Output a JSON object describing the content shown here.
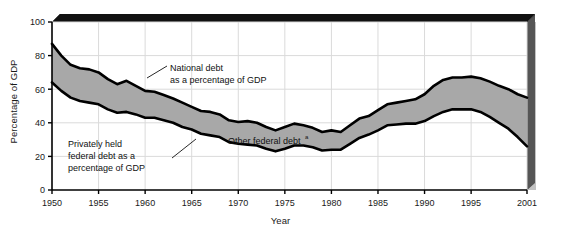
{
  "chart_data": {
    "type": "area",
    "title": "",
    "xlabel": "Year",
    "ylabel": "Percentage of GDP",
    "xlim": [
      1950,
      2001
    ],
    "ylim": [
      0,
      100
    ],
    "grid": true,
    "legend_position": "inline-annotations",
    "x_ticks": [
      "1950",
      "1955",
      "1960",
      "1965",
      "1970",
      "1975",
      "1980",
      "1985",
      "1990",
      "1995",
      "2001"
    ],
    "x_tick_values": [
      1950,
      1955,
      1960,
      1965,
      1970,
      1975,
      1980,
      1985,
      1990,
      1995,
      2001
    ],
    "y_ticks": [
      "0",
      "20",
      "40",
      "60",
      "80",
      "100"
    ],
    "y_tick_values": [
      0,
      20,
      40,
      60,
      80,
      100
    ],
    "x": [
      1950,
      1951,
      1952,
      1953,
      1954,
      1955,
      1956,
      1957,
      1958,
      1959,
      1960,
      1961,
      1962,
      1963,
      1964,
      1965,
      1966,
      1967,
      1968,
      1969,
      1970,
      1971,
      1972,
      1973,
      1974,
      1975,
      1976,
      1977,
      1978,
      1979,
      1980,
      1981,
      1982,
      1983,
      1984,
      1985,
      1986,
      1987,
      1988,
      1989,
      1990,
      1991,
      1992,
      1993,
      1994,
      1995,
      1996,
      1997,
      1998,
      1999,
      2000,
      2001
    ],
    "series": [
      {
        "name": "National debt as a percentage of GDP",
        "values": [
          87.0,
          80.0,
          74.5,
          72.5,
          71.8,
          70.0,
          66.0,
          63.0,
          65.0,
          62.0,
          59.0,
          58.5,
          56.5,
          54.5,
          52.0,
          49.5,
          47.0,
          46.5,
          45.0,
          41.5,
          40.5,
          41.0,
          40.0,
          37.5,
          35.5,
          37.5,
          39.5,
          38.5,
          37.0,
          34.5,
          35.5,
          34.5,
          38.5,
          42.5,
          44.0,
          47.5,
          51.0,
          52.0,
          53.0,
          54.0,
          57.0,
          62.0,
          65.5,
          67.0,
          67.0,
          67.5,
          66.5,
          64.5,
          62.0,
          60.0,
          57.0,
          55.0
        ]
      },
      {
        "name": "Privately held federal debt as a percentage of GDP",
        "values": [
          64.0,
          59.0,
          55.0,
          53.0,
          52.0,
          51.0,
          48.0,
          46.0,
          46.5,
          45.0,
          43.0,
          43.0,
          41.5,
          40.0,
          37.5,
          36.0,
          33.5,
          32.5,
          31.5,
          28.5,
          27.5,
          27.0,
          26.5,
          24.5,
          23.0,
          24.5,
          26.5,
          26.5,
          25.5,
          23.5,
          24.0,
          24.0,
          27.5,
          31.0,
          33.0,
          35.5,
          38.5,
          39.0,
          39.5,
          39.5,
          41.0,
          44.0,
          46.5,
          48.0,
          48.0,
          48.0,
          46.5,
          43.5,
          40.0,
          36.5,
          31.5,
          26.0
        ]
      }
    ],
    "annotations": [
      {
        "name": "national-debt-label",
        "lines": [
          "National debt",
          "as a percentage of GDP"
        ],
        "superscript": ""
      },
      {
        "name": "privately-held-debt-label",
        "lines": [
          "Privately held",
          "federal debt as a",
          "percentage of GDP"
        ],
        "superscript": ""
      },
      {
        "name": "other-federal-debt-label",
        "lines": [
          "Other federal debt"
        ],
        "superscript": "a"
      }
    ],
    "colors": {
      "band_fill": "#a8a8a8",
      "line": "#000000",
      "grid": "#d8d8d8",
      "axis": "#000000",
      "shadow": "#1c1c1c",
      "background": "#ffffff"
    }
  }
}
